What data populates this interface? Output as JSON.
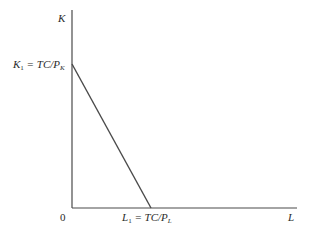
{
  "diagram": {
    "type": "budget-constraint / isocost line",
    "axes": {
      "y_label": "K",
      "x_label": "L",
      "origin_label": "0"
    },
    "intercepts": {
      "y_intercept": {
        "var": "K",
        "sub": "1",
        "eq": " = TC/P",
        "eq_sub": "K"
      },
      "x_intercept": {
        "var": "L",
        "sub": "1",
        "eq": " = TC/P",
        "eq_sub": "L"
      }
    },
    "colors": {
      "axis": "#4a4a4a",
      "line": "#4a4a4a",
      "text": "#2a2a2a"
    }
  }
}
